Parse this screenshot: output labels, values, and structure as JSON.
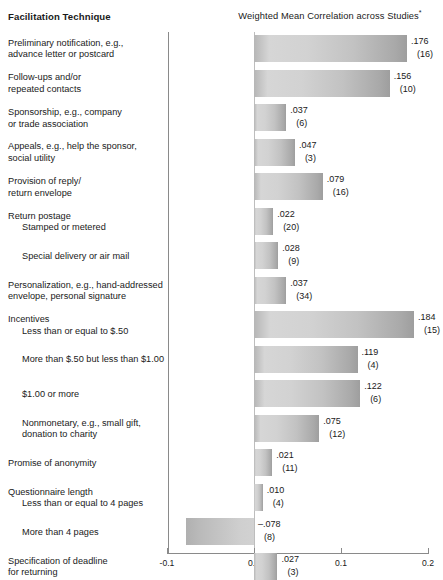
{
  "header": {
    "left_title": "Facilitation Technique",
    "right_title": "Weighted Mean Correlation across Studies",
    "footnote_mark": "*"
  },
  "axis": {
    "ticks": [
      "-0.1",
      "0.0",
      "0.1",
      "0.2"
    ],
    "tick_values": [
      -0.1,
      0.0,
      0.1,
      0.2
    ],
    "min": -0.1,
    "max": 0.2
  },
  "chart_data": {
    "type": "bar",
    "title": "Weighted Mean Correlation across Studies*",
    "xlabel": "Weighted Mean Correlation across Studies",
    "ylabel": "Facilitation Technique",
    "orientation": "horizontal",
    "xlim": [
      -0.1,
      0.2
    ],
    "xticks": [
      -0.1,
      0.0,
      0.1,
      0.2
    ],
    "xticklabels": [
      "-0.1",
      "0.0",
      "0.1",
      "0.2"
    ],
    "grid": false,
    "legend": "none",
    "value_label_key": "weighted mean correlation",
    "n_label_key": "number of studies (k)",
    "categories": [
      "Preliminary notification, e.g., advance letter or postcard",
      "Follow-ups and/or repeated contacts",
      "Sponsorship, e.g., company or trade association",
      "Appeals, e.g., help the sponsor, social utility",
      "Provision of reply/return envelope",
      "Return postage: Stamped or metered",
      "Return postage: Special delivery or air mail",
      "Personalization, e.g., hand-addressed envelope, personal signature",
      "Incentives: Less than or equal to $.50",
      "Incentives: More than $.50 but less than $1.00",
      "Incentives: $1.00 or more",
      "Incentives: Nonmonetary, e.g., small gift, donation to charity",
      "Promise of anonymity",
      "Questionnaire length: Less than or equal to 4 pages",
      "Questionnaire length: More than 4 pages",
      "Specification of deadline for returning"
    ],
    "values": [
      0.176,
      0.156,
      0.037,
      0.047,
      0.079,
      0.022,
      0.028,
      0.037,
      0.184,
      0.119,
      0.122,
      0.075,
      0.021,
      0.01,
      -0.078,
      0.027
    ],
    "study_counts": [
      16,
      10,
      6,
      3,
      16,
      20,
      9,
      34,
      15,
      4,
      6,
      12,
      11,
      4,
      8,
      3
    ]
  },
  "rows": [
    {
      "lines": [
        "Preliminary notification, e.g.,",
        "advance letter or postcard"
      ],
      "indent": false,
      "group_head": null,
      "value": ".176",
      "n": "(16)",
      "raw": 0.176
    },
    {
      "lines": [
        "Follow-ups and/or",
        "repeated contacts"
      ],
      "indent": false,
      "group_head": null,
      "value": ".156",
      "n": "(10)",
      "raw": 0.156
    },
    {
      "lines": [
        "Sponsorship, e.g., company",
        "or trade association"
      ],
      "indent": false,
      "group_head": null,
      "value": ".037",
      "n": "(6)",
      "raw": 0.037
    },
    {
      "lines": [
        "Appeals, e.g., help the sponsor,",
        "social utility"
      ],
      "indent": false,
      "group_head": null,
      "value": ".047",
      "n": "(3)",
      "raw": 0.047
    },
    {
      "lines": [
        "Provision of reply/",
        "return envelope"
      ],
      "indent": false,
      "group_head": null,
      "value": ".079",
      "n": "(16)",
      "raw": 0.079
    },
    {
      "lines": [
        "Stamped or metered"
      ],
      "indent": true,
      "group_head": "Return postage",
      "value": ".022",
      "n": "(20)",
      "raw": 0.022
    },
    {
      "lines": [
        "Special delivery or air mail"
      ],
      "indent": true,
      "group_head": null,
      "value": ".028",
      "n": "(9)",
      "raw": 0.028
    },
    {
      "lines": [
        "Personalization, e.g., hand-addressed",
        "envelope, personal signature"
      ],
      "indent": false,
      "group_head": null,
      "value": ".037",
      "n": "(34)",
      "raw": 0.037
    },
    {
      "lines": [
        "Less than or equal to $.50"
      ],
      "indent": true,
      "group_head": "Incentives",
      "value": ".184",
      "n": "(15)",
      "raw": 0.184
    },
    {
      "lines": [
        "More than $.50 but less than $1.00"
      ],
      "indent": true,
      "group_head": null,
      "value": ".119",
      "n": "(4)",
      "raw": 0.119
    },
    {
      "lines": [
        "$1.00 or more"
      ],
      "indent": true,
      "group_head": null,
      "value": ".122",
      "n": "(6)",
      "raw": 0.122
    },
    {
      "lines": [
        "Nonmonetary, e.g., small gift,",
        "donation to charity"
      ],
      "indent": true,
      "group_head": null,
      "value": ".075",
      "n": "(12)",
      "raw": 0.075
    },
    {
      "lines": [
        "Promise of anonymity"
      ],
      "indent": false,
      "group_head": null,
      "value": ".021",
      "n": "(11)",
      "raw": 0.021
    },
    {
      "lines": [
        "Less than or equal to 4 pages"
      ],
      "indent": true,
      "group_head": "Questionnaire length",
      "value": ".010",
      "n": "(4)",
      "raw": 0.01
    },
    {
      "lines": [
        "More than 4 pages"
      ],
      "indent": true,
      "group_head": null,
      "value": "–.078",
      "n": "(8)",
      "raw": -0.078
    },
    {
      "lines": [
        "Specification of deadline",
        "for returning"
      ],
      "indent": false,
      "group_head": null,
      "value": ".027",
      "n": "(3)",
      "raw": 0.027
    }
  ]
}
